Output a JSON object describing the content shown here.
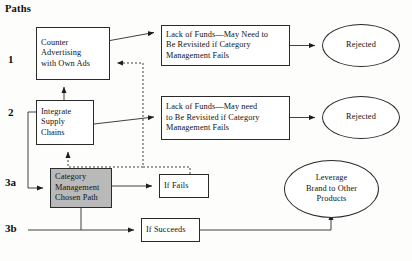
{
  "diagram": {
    "title": "Paths",
    "row_labels": [
      {
        "name": "path-1",
        "text": "1",
        "x": 8,
        "y": 53
      },
      {
        "name": "path-2",
        "text": "2",
        "x": 8,
        "y": 106
      },
      {
        "name": "path-3a",
        "text": "3a",
        "x": 5,
        "y": 176
      },
      {
        "name": "path-3b",
        "text": "3b",
        "x": 5,
        "y": 222
      }
    ],
    "boxes": [
      {
        "name": "counter-advertising-box",
        "lines": [
          "Counter",
          "Advertising",
          "with Own Ads"
        ],
        "x": 36,
        "y": 27,
        "w": 74,
        "h": 53,
        "shaded": false
      },
      {
        "name": "lack-of-funds-box-1",
        "lines": [
          "Lack of Funds—May Need to",
          "Be Revisited if Category",
          "Management Fails"
        ],
        "x": 161,
        "y": 25,
        "w": 129,
        "h": 41,
        "shaded": false
      },
      {
        "name": "integrate-supply-chains-box",
        "lines": [
          "Integrate",
          "Supply",
          "Chains"
        ],
        "x": 36,
        "y": 100,
        "w": 58,
        "h": 45,
        "shaded": false
      },
      {
        "name": "lack-of-funds-box-2",
        "lines": [
          "Lack of Funds—May need",
          "to Be Revisited if Category",
          "Management Fails"
        ],
        "x": 161,
        "y": 96,
        "w": 129,
        "h": 44,
        "shaded": false
      },
      {
        "name": "category-management-chosen-path-box",
        "lines": [
          "Category",
          "Management",
          "Chosen Path"
        ],
        "x": 50,
        "y": 168,
        "w": 62,
        "h": 40,
        "shaded": true
      },
      {
        "name": "if-fails-box",
        "lines": [
          "If Fails"
        ],
        "x": 159,
        "y": 174,
        "w": 50,
        "h": 24,
        "shaded": false
      },
      {
        "name": "if-succeeds-box",
        "lines": [
          "If Succeeds"
        ],
        "x": 141,
        "y": 218,
        "w": 59,
        "h": 24,
        "shaded": false
      }
    ],
    "ellipses": [
      {
        "name": "rejected-ellipse-1",
        "lines": [
          "Rejected"
        ],
        "x": 322,
        "y": 24,
        "w": 78,
        "h": 43
      },
      {
        "name": "rejected-ellipse-2",
        "lines": [
          "Rejected"
        ],
        "x": 322,
        "y": 96,
        "w": 78,
        "h": 43
      },
      {
        "name": "leverage-brand-ellipse",
        "lines": [
          "Leverage",
          "Brand to Other",
          "Products"
        ],
        "x": 284,
        "y": 160,
        "w": 95,
        "h": 58
      }
    ],
    "connectors": [
      {
        "name": "counter-advertising-to-lack-of-funds-1",
        "style": "solid"
      },
      {
        "name": "lack-of-funds-1-to-rejected-1",
        "style": "solid"
      },
      {
        "name": "integrate-to-counter-advertising",
        "style": "solid"
      },
      {
        "name": "integrate-to-lack-of-funds-2",
        "style": "solid"
      },
      {
        "name": "lack-of-funds-2-to-rejected-2",
        "style": "solid"
      },
      {
        "name": "integrate-to-category-management-loop",
        "style": "solid"
      },
      {
        "name": "category-management-to-if-fails",
        "style": "solid"
      },
      {
        "name": "category-management-to-if-succeeds",
        "style": "solid"
      },
      {
        "name": "if-succeeds-to-leverage-brand",
        "style": "solid"
      },
      {
        "name": "if-fails-feedback-to-counter-advertising",
        "style": "dashed"
      },
      {
        "name": "if-fails-feedback-to-integrate",
        "style": "dashed"
      }
    ]
  }
}
